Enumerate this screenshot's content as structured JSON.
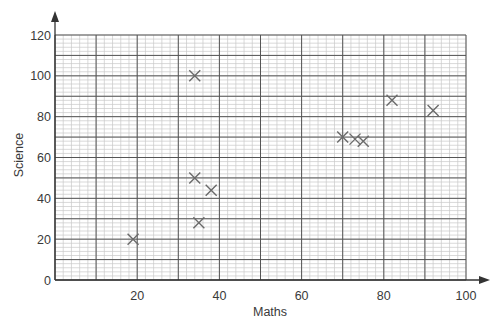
{
  "chart_data": {
    "type": "scatter",
    "title": "",
    "xlabel": "Maths",
    "ylabel": "Science",
    "xlim": [
      0,
      100
    ],
    "ylim": [
      0,
      120
    ],
    "x_ticks": [
      20,
      40,
      60,
      80,
      100
    ],
    "y_ticks": [
      0,
      20,
      40,
      60,
      80,
      100,
      120
    ],
    "x_major_step": 10,
    "y_major_step": 20,
    "x_minor_step": 2,
    "y_minor_step": 2,
    "grid": true,
    "marker": "x",
    "series": [
      {
        "name": "Students",
        "points": [
          {
            "x": 19,
            "y": 20
          },
          {
            "x": 34,
            "y": 100
          },
          {
            "x": 34,
            "y": 50
          },
          {
            "x": 38,
            "y": 44
          },
          {
            "x": 35,
            "y": 28
          },
          {
            "x": 70,
            "y": 70
          },
          {
            "x": 73,
            "y": 69
          },
          {
            "x": 75,
            "y": 68
          },
          {
            "x": 82,
            "y": 88
          },
          {
            "x": 92,
            "y": 83
          }
        ]
      }
    ],
    "colors": {
      "axis": "#333333",
      "major_grid": "#555555",
      "minor_grid": "#c8c8c8",
      "marker": "#6a6a6a",
      "text": "#3a3a3a"
    }
  }
}
